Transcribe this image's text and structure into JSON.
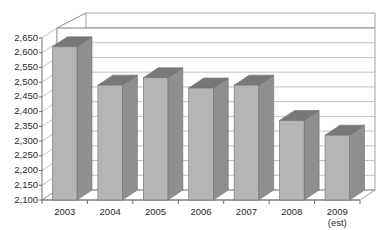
{
  "chart_data": {
    "type": "bar",
    "title": "",
    "subtitle": "",
    "xlabel": "",
    "ylabel": "",
    "categories": [
      "2003",
      "2004",
      "2005",
      "2006",
      "2007",
      "2008",
      "2009"
    ],
    "category_sublabels": [
      "",
      "",
      "",
      "",
      "",
      "",
      "(est)"
    ],
    "values": [
      2620,
      2490,
      2515,
      2480,
      2490,
      2370,
      2320
    ],
    "ylim": [
      2100,
      2650
    ],
    "ytick_step": 50,
    "ytick_labels": [
      "2,650",
      "2,600",
      "2,550",
      "2,500",
      "2,450",
      "2,400",
      "2,350",
      "2,300",
      "2,250",
      "2,200",
      "2,150",
      "2,100"
    ],
    "ytick_values": [
      2650,
      2600,
      2550,
      2500,
      2450,
      2400,
      2350,
      2300,
      2250,
      2200,
      2150,
      2100
    ],
    "grid": true,
    "grid_axis": "y",
    "legend": false,
    "legend_position": "none",
    "three_d": true,
    "annotations": []
  },
  "style": {
    "bar_front_color": "#b5b5b5",
    "bar_side_color": "#8f8f8f",
    "bar_top_color": "#787878",
    "bar_outline_color": "#6e6e6e",
    "plot_background": "#ffffff",
    "wall_color": "#ffffff",
    "floor_color": "#ffffff",
    "grid_color": "#9a9a9a",
    "axis_color": "#6e6e6e",
    "tick_label_color": "#2a2a2a"
  }
}
